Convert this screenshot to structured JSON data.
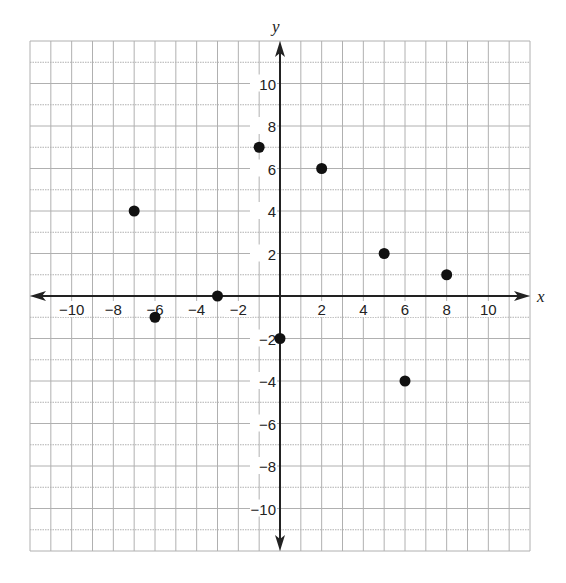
{
  "chart_data": {
    "type": "scatter",
    "title": "",
    "xlabel": "x",
    "ylabel": "y",
    "xlim": [
      -12,
      12
    ],
    "ylim": [
      -12,
      12
    ],
    "grid": true,
    "x_ticks": [
      -10,
      -8,
      -6,
      -4,
      -2,
      2,
      4,
      6,
      8,
      10
    ],
    "y_ticks": [
      10,
      8,
      6,
      4,
      2,
      -2,
      -4,
      -6,
      -8,
      -10
    ],
    "points": [
      {
        "x": -7,
        "y": 4
      },
      {
        "x": -6,
        "y": -1
      },
      {
        "x": -3,
        "y": 0
      },
      {
        "x": -1,
        "y": 7
      },
      {
        "x": 0,
        "y": -2
      },
      {
        "x": 2,
        "y": 6
      },
      {
        "x": 5,
        "y": 2
      },
      {
        "x": 6,
        "y": -4
      },
      {
        "x": 8,
        "y": 1
      }
    ],
    "colors": {
      "point": "#111111",
      "axis": "#222222",
      "grid": "#b0b0b0"
    }
  }
}
